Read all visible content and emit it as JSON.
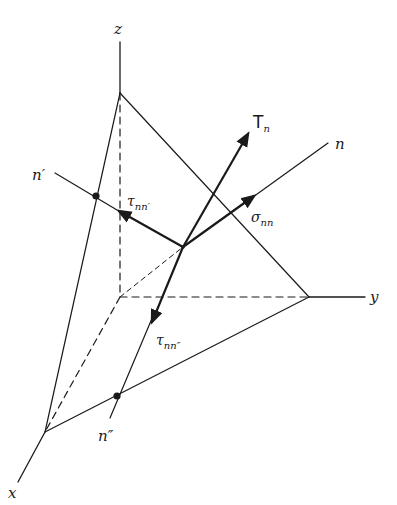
{
  "figure": {
    "type": "stress-tetrahedron"
  },
  "colors": {
    "background": "#ffffff",
    "ink": "#1a1a1a"
  },
  "axes": {
    "z": {
      "label": "z"
    },
    "y": {
      "label": "y"
    },
    "x": {
      "label": "x"
    }
  },
  "directions": {
    "n": {
      "label": "n"
    },
    "n_prime": {
      "label": "n′"
    },
    "n_double_prime": {
      "label": "n″"
    }
  },
  "vectors": {
    "traction": {
      "symbol": "T",
      "subscript": "n"
    },
    "normal_stress": {
      "symbol": "σ",
      "subscript": "nn"
    },
    "shear_stress_1": {
      "symbol": "τ",
      "subscript": "nn′"
    },
    "shear_stress_2": {
      "symbol": "τ",
      "subscript": "nn″"
    }
  }
}
